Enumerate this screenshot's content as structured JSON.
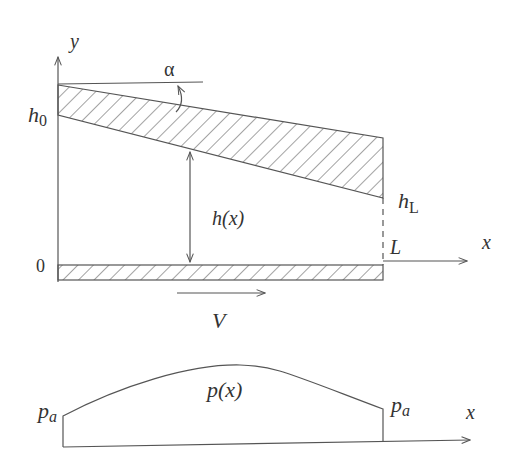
{
  "figure": {
    "top_diagram": {
      "y_axis_label": "y",
      "x_axis_label": "x",
      "angle_label": "α",
      "h0_main": "h",
      "h0_sub": "0",
      "hL_main": "h",
      "hL_sub": "L",
      "gap_label": "h(x)",
      "origin_label": "0",
      "length_label": "L",
      "velocity_label": "V"
    },
    "bottom_diagram": {
      "pressure_label": "p(x)",
      "left_pa_main": "p",
      "left_pa_sub": "a",
      "right_pa_main": "p",
      "right_pa_sub": "a",
      "x_axis_label": "x"
    },
    "colors": {
      "line": "#555555",
      "text": "#333333",
      "background": "#ffffff"
    }
  }
}
